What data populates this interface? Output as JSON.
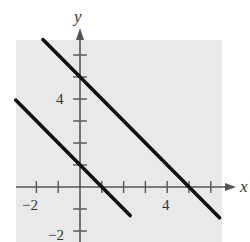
{
  "chart_data": {
    "type": "line",
    "title": "",
    "xlabel": "x",
    "ylabel": "y",
    "xlim": [
      -2.9,
      6.4
    ],
    "ylim": [
      -2.5,
      6.7
    ],
    "grid": false,
    "background": "#e9e9e9",
    "x_ticks": [
      -2,
      -1,
      0,
      1,
      2,
      3,
      4,
      5,
      6
    ],
    "y_ticks": [
      -2,
      -1,
      1,
      2,
      3,
      4,
      5,
      6
    ],
    "x_tick_labels": [
      {
        "value": -2,
        "label": "−2"
      },
      {
        "value": 4,
        "label": "4"
      }
    ],
    "y_tick_labels": [
      {
        "value": 4,
        "label": "4"
      },
      {
        "value": -2,
        "label": "−2"
      }
    ],
    "series": [
      {
        "name": "upper line",
        "equation": "y = -x + 5",
        "x": [
          -1.7,
          6.4
        ],
        "y": [
          6.7,
          -1.4
        ],
        "color": "#111111"
      },
      {
        "name": "lower line",
        "equation": "y = -x + 1",
        "x": [
          -2.95,
          2.3
        ],
        "y": [
          3.95,
          -1.3
        ],
        "color": "#111111"
      }
    ]
  },
  "labels": {
    "x_axis": "x",
    "y_axis": "y",
    "x_neg2": "−2",
    "x_4": "4",
    "y_4": "4",
    "y_neg2": "−2"
  }
}
